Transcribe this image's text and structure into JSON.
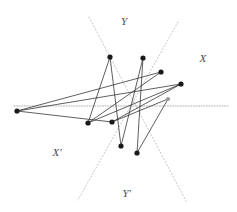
{
  "figure": {
    "name": "crossing-lines-geometric-figure",
    "width": 237,
    "height": 212,
    "background": "#ffffff"
  },
  "colors": {
    "polyline": "#2b2b2b",
    "vertex": "#1a1a1a",
    "vertex_faint": "#9a9a9a",
    "guide_dotted": "#bdbdbd",
    "guide_dotted_dark": "#a8a8a8",
    "label": "#4a4a4a"
  },
  "labels": [
    {
      "id": "Y",
      "text": "Y",
      "x": 124,
      "y": 21,
      "anchor": "middle"
    },
    {
      "id": "X",
      "text": "X",
      "x": 203,
      "y": 58,
      "anchor": "middle"
    },
    {
      "id": "Xp",
      "text": "X′",
      "x": 57,
      "y": 152,
      "anchor": "middle"
    },
    {
      "id": "Yp",
      "text": "Y′",
      "x": 127,
      "y": 193,
      "anchor": "middle"
    }
  ],
  "guides": [
    {
      "id": "asymptote-upper-left-to-lower-right",
      "style": "dotted",
      "x1": 89,
      "y1": 17,
      "x2": 186,
      "y2": 201
    },
    {
      "id": "asymptote-upper-right-to-lower-left",
      "style": "dotted",
      "x1": 178,
      "y1": 22,
      "x2": 78,
      "y2": 200
    },
    {
      "id": "horizontal-axis",
      "style": "dotted",
      "x1": 14,
      "y1": 106,
      "x2": 228,
      "y2": 106
    }
  ],
  "points": [
    {
      "id": "p1",
      "label": "A",
      "x": 110,
      "y": 57,
      "kind": "solid"
    },
    {
      "id": "p2",
      "label": "B",
      "x": 143,
      "y": 58,
      "kind": "solid"
    },
    {
      "id": "p3",
      "label": "C",
      "x": 161,
      "y": 72,
      "kind": "solid"
    },
    {
      "id": "p4",
      "label": "D",
      "x": 181,
      "y": 84,
      "kind": "solid"
    },
    {
      "id": "p5",
      "label": "E",
      "x": 17,
      "y": 111,
      "kind": "solid"
    },
    {
      "id": "p6",
      "label": "F",
      "x": 168,
      "y": 99,
      "kind": "faint"
    },
    {
      "id": "p7",
      "label": "G",
      "x": 88,
      "y": 123,
      "kind": "solid"
    },
    {
      "id": "p8",
      "label": "H",
      "x": 112,
      "y": 122,
      "kind": "solid"
    },
    {
      "id": "p9",
      "label": "I",
      "x": 121,
      "y": 146,
      "kind": "solid"
    },
    {
      "id": "p10",
      "label": "J",
      "x": 137,
      "y": 153,
      "kind": "solid"
    }
  ],
  "segments": [
    {
      "id": "s1",
      "from": "p5",
      "to": "p3"
    },
    {
      "id": "s2",
      "from": "p3",
      "to": "p7"
    },
    {
      "id": "s3",
      "from": "p7",
      "to": "p1"
    },
    {
      "id": "s4",
      "from": "p1",
      "to": "p9"
    },
    {
      "id": "s5",
      "from": "p9",
      "to": "p2"
    },
    {
      "id": "s6",
      "from": "p2",
      "to": "p10"
    },
    {
      "id": "s7",
      "from": "p10",
      "to": "p6"
    },
    {
      "id": "s8",
      "from": "p6",
      "to": "p8"
    },
    {
      "id": "s9",
      "from": "p8",
      "to": "p4"
    },
    {
      "id": "s10",
      "from": "p4",
      "to": "p5"
    },
    {
      "id": "s11",
      "from": "p5",
      "to": "p8"
    },
    {
      "id": "s12",
      "from": "p7",
      "to": "p4"
    }
  ]
}
